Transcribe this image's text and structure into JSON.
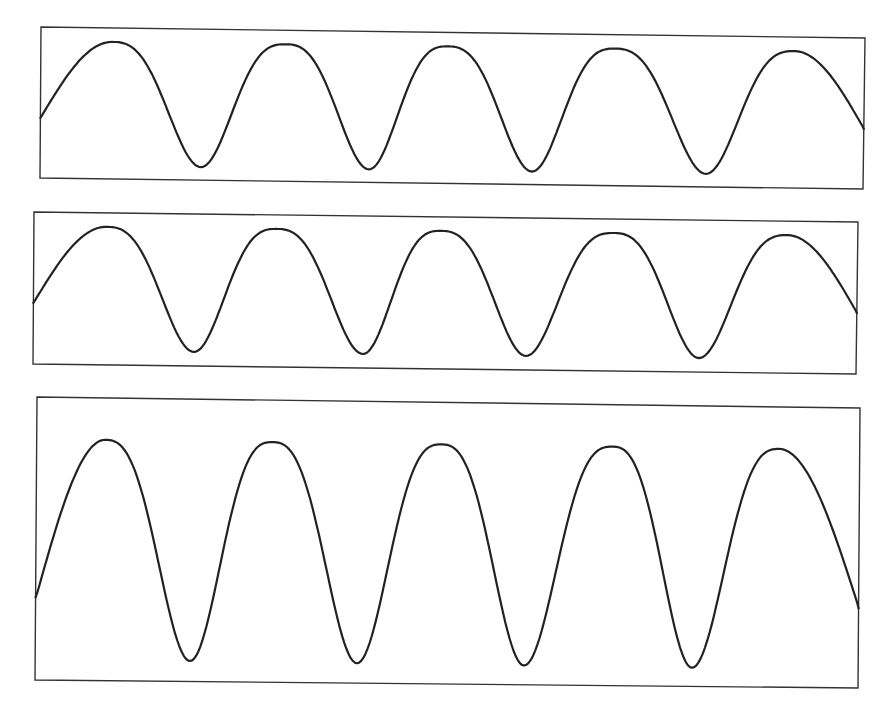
{
  "figure": {
    "background_color": "#ffffff",
    "line_color": "#222222",
    "frame_color": "#333333",
    "panels": [
      {
        "id": "panel-1",
        "frame": {
          "tl": [
            41,
            27
          ],
          "tr": [
            865,
            38
          ],
          "br": [
            863,
            189
          ],
          "bl": [
            40,
            178
          ]
        },
        "waveform": {
          "cycles": 5,
          "start_phase_level": 0.62,
          "peak_y_offset": 14,
          "trough_y_offset": 138,
          "peak_x": [
            112,
            285,
            447,
            614,
            794
          ],
          "trough_x": [
            201,
            369,
            532,
            706
          ],
          "shape": "broad-peak-narrow-trough"
        }
      },
      {
        "id": "panel-2",
        "frame": {
          "tl": [
            34,
            212
          ],
          "tr": [
            858,
            222
          ],
          "br": [
            856,
            374
          ],
          "bl": [
            33,
            364
          ]
        },
        "waveform": {
          "cycles": 5,
          "start_phase_level": 0.62,
          "peak_y_offset": 14,
          "trough_y_offset": 138,
          "peak_x": [
            106,
            276,
            440,
            613,
            787
          ],
          "trough_x": [
            194,
            363,
            526,
            699
          ],
          "shape": "broad-peak-narrow-trough"
        }
      },
      {
        "id": "panel-3",
        "frame": {
          "tl": [
            37,
            397
          ],
          "tr": [
            860,
            408
          ],
          "br": [
            858,
            688
          ],
          "bl": [
            35,
            680
          ]
        },
        "waveform": {
          "cycles": 5,
          "start_phase_level": 0.72,
          "peak_y_offset": 42,
          "trough_y_offset": 262,
          "peak_x": [
            105,
            272,
            441,
            612,
            779
          ],
          "trough_x": [
            190,
            357,
            524,
            692
          ],
          "shape": "narrow-trough-tall-peaks"
        }
      }
    ]
  }
}
